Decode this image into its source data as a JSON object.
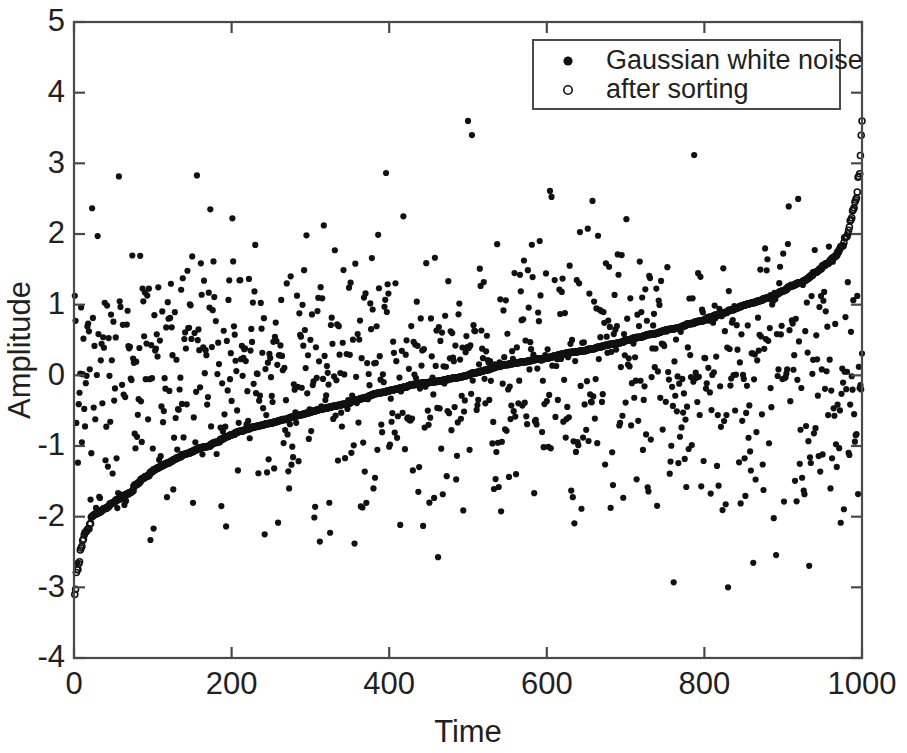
{
  "chart_data": {
    "type": "scatter",
    "title": "",
    "xlabel": "Time",
    "ylabel": "Amplitude",
    "xlim": [
      0,
      1000
    ],
    "ylim": [
      -4,
      5
    ],
    "xticks": [
      0,
      200,
      400,
      600,
      800,
      1000
    ],
    "yticks": [
      -4,
      -3,
      -2,
      -1,
      0,
      1,
      2,
      3,
      4,
      5
    ],
    "xtick_labels": [
      "0",
      "200",
      "400",
      "600",
      "800",
      "1000"
    ],
    "ytick_labels": [
      "-4",
      "-3",
      "-2",
      "-1",
      "0",
      "1",
      "2",
      "3",
      "4",
      "5"
    ],
    "grid": false,
    "legend_position": "top-right",
    "n_points": 1000,
    "series": [
      {
        "name": "Gaussian white noise",
        "marker": "filled-circle",
        "color": "#111111",
        "distribution": "gaussian",
        "mean": 0,
        "std": 1.0,
        "observed_min": -3.0,
        "observed_max": 3.6
      },
      {
        "name": "after sorting",
        "marker": "open-circle",
        "color": "#111111",
        "description": "same 1000 samples sorted ascending, forming a monotonic S-curve",
        "start_value": -3.1,
        "end_value": 3.6
      }
    ],
    "notable_points": [
      {
        "time": 500,
        "amplitude": 3.6,
        "series": "Gaussian white noise",
        "note": "high outlier"
      },
      {
        "time": 505,
        "amplitude": 3.4,
        "series": "Gaussian white noise",
        "note": "high outlier"
      },
      {
        "time": 830,
        "amplitude": -3.0,
        "series": "Gaussian white noise",
        "note": "low outlier"
      },
      {
        "time": 1,
        "amplitude": -3.1,
        "series": "after sorting",
        "note": "sorted minimum"
      },
      {
        "time": 1000,
        "amplitude": 3.6,
        "series": "after sorting",
        "note": "sorted maximum"
      }
    ]
  },
  "axes": {
    "xlabel": "Time",
    "ylabel": "Amplitude"
  },
  "legend": {
    "entries": [
      {
        "label": "Gaussian white noise",
        "marker": "filled-circle"
      },
      {
        "label": "after sorting",
        "marker": "open-circle"
      }
    ]
  }
}
